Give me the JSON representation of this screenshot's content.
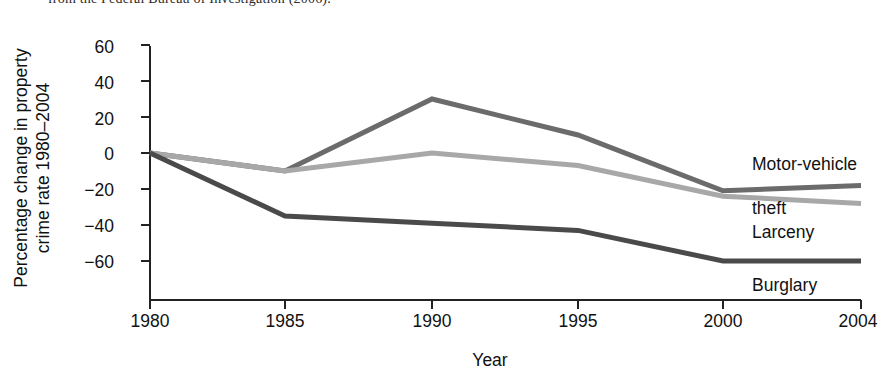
{
  "caption": {
    "text": "from the Federal Bureau of Investigation (2006)."
  },
  "chart_data": {
    "type": "line",
    "title": "",
    "xlabel": "Year",
    "ylabel": "Percentage change in property crime rate 1980–2004",
    "ylabel_line1": "Percentage change in property",
    "ylabel_line2": "crime rate 1980–2004",
    "x": [
      1980,
      1985,
      1990,
      1995,
      2000,
      2004
    ],
    "xtick_labels": [
      "1980",
      "1985",
      "1990",
      "1995",
      "2000",
      "2004"
    ],
    "ytick_labels": [
      "60",
      "40",
      "20",
      "0",
      "−20",
      "−40",
      "−60"
    ],
    "ytick_values": [
      60,
      40,
      20,
      0,
      -20,
      -40,
      -60
    ],
    "xlim": [
      1980,
      2004
    ],
    "ylim": [
      -60,
      60
    ],
    "grid": false,
    "legend_position": "right-inline-annotations",
    "series": [
      {
        "name": "Motor-vehicle theft",
        "label_line1": "Motor-vehicle",
        "label_line2": "theft",
        "color": "#6b6b6b",
        "values": [
          0,
          -10,
          30,
          10,
          -21,
          -18
        ]
      },
      {
        "name": "Larceny",
        "label_line1": "Larceny",
        "label_line2": "",
        "color": "#a8a8a8",
        "values": [
          0,
          -10,
          0,
          -7,
          -24,
          -28
        ]
      },
      {
        "name": "Burglary",
        "label_line1": "Burglary",
        "label_line2": "",
        "color": "#4a4a4a",
        "values": [
          0,
          -35,
          -39,
          -43,
          -60,
          -60
        ]
      }
    ]
  },
  "axes": {
    "axis_color": "#222222",
    "background": "#ffffff"
  }
}
